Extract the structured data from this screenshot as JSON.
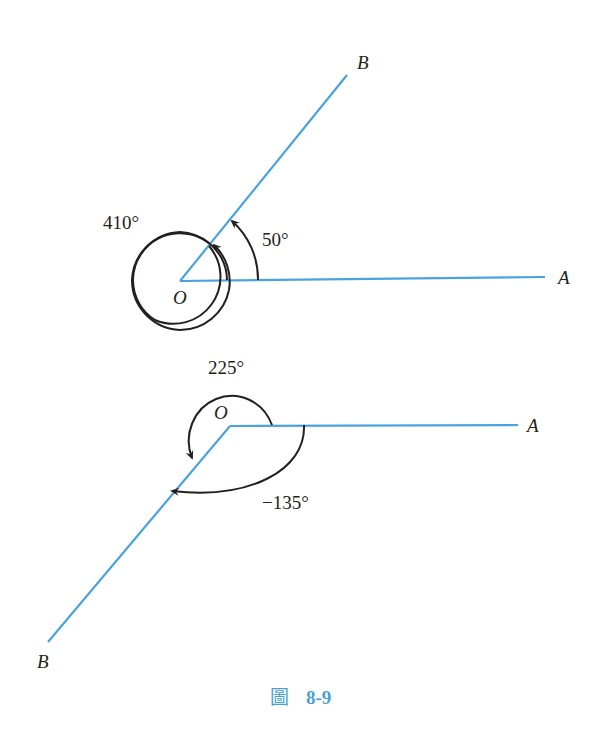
{
  "figure": {
    "caption_prefix": "圖",
    "caption_number": "8-9",
    "colors": {
      "ray": "#4aa3df",
      "arc": "#231f20",
      "caption": "#4a9fd8"
    }
  },
  "top_diagram": {
    "vertex_label": "O",
    "initial_side_label": "A",
    "terminal_side_label": "B",
    "angles": [
      {
        "label": "50°",
        "value": 50,
        "direction": "counterclockwise"
      },
      {
        "label": "410°",
        "value": 410,
        "direction": "counterclockwise"
      }
    ]
  },
  "bottom_diagram": {
    "vertex_label": "O",
    "initial_side_label": "A",
    "terminal_side_label": "B",
    "angles": [
      {
        "label": "225°",
        "value": 225,
        "direction": "counterclockwise"
      },
      {
        "label": "−135°",
        "value": -135,
        "direction": "clockwise"
      }
    ]
  }
}
